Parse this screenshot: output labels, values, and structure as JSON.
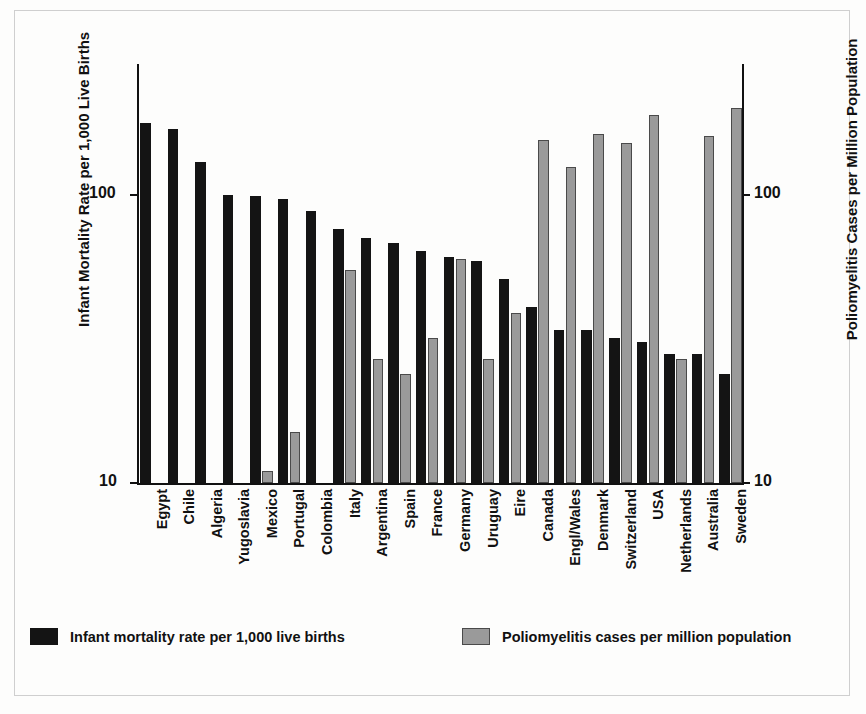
{
  "chart_data": {
    "type": "bar",
    "title": "",
    "subtitle": "",
    "scale": "log",
    "grid": false,
    "legend_position": "bottom",
    "xlabel": "",
    "ylabel": "Infant Mortality Rate per 1,000 Live Births",
    "y2label": "Poliomyelitis Cases per Million Population",
    "ylim": [
      10,
      230
    ],
    "y2lim": [
      10,
      230
    ],
    "yticks": [
      10,
      100
    ],
    "ytick_labels": [
      "10",
      "100"
    ],
    "y2ticks": [
      10,
      100
    ],
    "y2tick_labels": [
      "10",
      "100"
    ],
    "categories": [
      "Egypt",
      "Chile",
      "Algeria",
      "Yugoslavia",
      "Mexico",
      "Portugal",
      "Colombia",
      "Italy",
      "Argentina",
      "Spain",
      "France",
      "Germany",
      "Uruguay",
      "Eire",
      "Canada",
      "Engl/Wales",
      "Denmark",
      "Switzerland",
      "USA",
      "Netherlands",
      "Australia",
      "Sweden"
    ],
    "series": [
      {
        "name": "Infant mortality rate per 1,000 live births",
        "color": "#141414",
        "values": [
          178,
          170,
          130,
          100,
          99,
          97,
          88,
          76,
          71,
          68,
          64,
          61,
          59,
          51,
          41,
          34,
          34,
          32,
          31,
          28,
          28,
          24
        ]
      },
      {
        "name": "Poliomyelitis cases per million population",
        "color": "#9a9a9a",
        "values": [
          null,
          null,
          null,
          null,
          11,
          15,
          null,
          55,
          27,
          24,
          32,
          60,
          27,
          39,
          155,
          125,
          163,
          151,
          189,
          27,
          160,
          200
        ]
      }
    ]
  },
  "axes": {
    "left_title": "Infant Mortality Rate per 1,000 Live Births",
    "right_title": "Poliomyelitis Cases per Million Population",
    "left_ticks": [
      "100",
      "10"
    ],
    "right_ticks": [
      "100",
      "10"
    ]
  },
  "legend": {
    "items": [
      {
        "label": "Infant mortality rate per 1,000 live births",
        "color": "#141414",
        "swatch": "imr"
      },
      {
        "label": "Poliomyelitis cases per million population",
        "color": "#9a9a9a",
        "swatch": "polio"
      }
    ]
  }
}
